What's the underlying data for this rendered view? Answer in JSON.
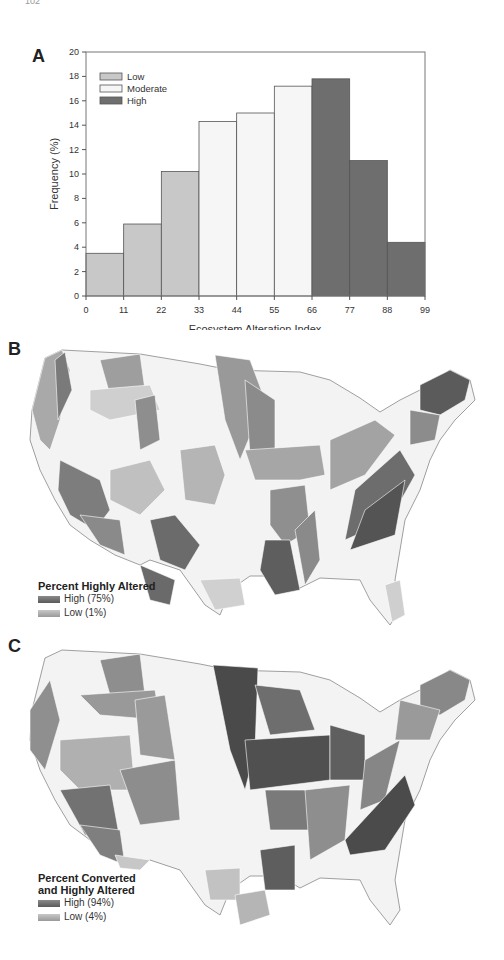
{
  "page_number": "102",
  "panels": {
    "A": {
      "letter": "A"
    },
    "B": {
      "letter": "B"
    },
    "C": {
      "letter": "C"
    }
  },
  "chart_data": [
    {
      "panel": "A",
      "type": "bar",
      "title": "",
      "xlabel": "Ecosystem Alteration Index",
      "ylabel": "Frequency (%)",
      "ylim": [
        0,
        20
      ],
      "yticks": [
        "0",
        "2",
        "4",
        "6",
        "8",
        "10",
        "12",
        "14",
        "16",
        "18",
        "20"
      ],
      "xticks": [
        "0",
        "11",
        "22",
        "33",
        "44",
        "55",
        "66",
        "77",
        "88",
        "99"
      ],
      "categories": [
        "0-11",
        "11-22",
        "22-33",
        "33-44",
        "44-55",
        "55-66",
        "66-77",
        "77-88",
        "88-99"
      ],
      "values": [
        3.5,
        5.9,
        10.2,
        14.3,
        15.0,
        17.2,
        17.8,
        11.1,
        4.4
      ],
      "classes": [
        "Low",
        "Low",
        "Low",
        "Moderate",
        "Moderate",
        "Moderate",
        "High",
        "High",
        "High"
      ],
      "legend": [
        {
          "label": "Low",
          "color": "#c8c8c8"
        },
        {
          "label": "Moderate",
          "color": "#f6f6f6"
        },
        {
          "label": "High",
          "color": "#6e6e6e"
        }
      ],
      "legend_position": "upper-left",
      "grid": false
    },
    {
      "panel": "B",
      "type": "heatmap",
      "title": "Percent Highly Altered",
      "legend": [
        {
          "label": "High (75%)",
          "color": "#5a5a5a"
        },
        {
          "label": "Low (1%)",
          "color": "#bdbdbd"
        }
      ]
    },
    {
      "panel": "C",
      "type": "heatmap",
      "title": "Percent Converted and Highly Altered",
      "legend": [
        {
          "label": "High (94%)",
          "color": "#5a5a5a"
        },
        {
          "label": "Low (4%)",
          "color": "#bdbdbd"
        }
      ]
    }
  ],
  "map_B": {
    "legend_title": "Percent Highly Altered",
    "legend_high": "High (75%)",
    "legend_low": "Low (1%)"
  },
  "map_C": {
    "legend_title_line1": "Percent Converted",
    "legend_title_line2": "and Highly Altered",
    "legend_high": "High (94%)",
    "legend_low": "Low (4%)"
  }
}
